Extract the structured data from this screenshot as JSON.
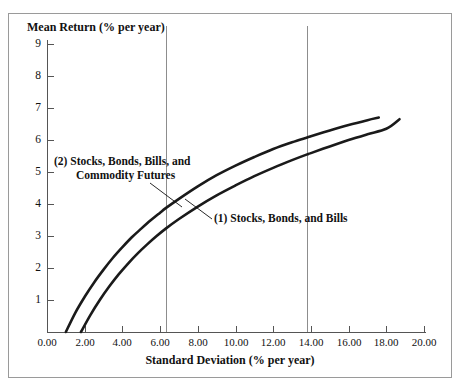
{
  "chart_data": {
    "type": "line",
    "title": "",
    "xlabel": "Standard Deviation (% per year)",
    "ylabel": "Mean Return (% per year)",
    "xlim": [
      0.0,
      20.0
    ],
    "ylim": [
      0.0,
      9.4
    ],
    "xticks": [
      "0.00",
      "2.00",
      "4.00",
      "6.00",
      "8.00",
      "10.00",
      "12.00",
      "14.00",
      "16.00",
      "18.00",
      "20.00"
    ],
    "xtick_values": [
      0,
      2,
      4,
      6,
      8,
      10,
      12,
      14,
      16,
      18,
      20
    ],
    "yticks": [
      "1",
      "2",
      "3",
      "4",
      "5",
      "6",
      "7",
      "8",
      "9"
    ],
    "ytick_values": [
      1,
      2,
      3,
      4,
      5,
      6,
      7,
      8,
      9
    ],
    "grid": false,
    "legend_position": "inline-annotations",
    "reference_lines": [
      {
        "name": "vline-left",
        "x": 6.3
      },
      {
        "name": "vline-right",
        "x": 13.8
      }
    ],
    "series": [
      {
        "name": "(2) Stocks, Bonds, Bills, and Commodity Futures",
        "label_number": "(2)",
        "label_text_line1": "Stocks, Bonds, Bills, and",
        "label_text_line2": "Commodity Futures",
        "points": [
          [
            1.0,
            0.0
          ],
          [
            1.5,
            0.6
          ],
          [
            2.0,
            1.1
          ],
          [
            2.5,
            1.55
          ],
          [
            3.0,
            1.95
          ],
          [
            3.5,
            2.32
          ],
          [
            4.0,
            2.65
          ],
          [
            4.5,
            2.96
          ],
          [
            5.0,
            3.23
          ],
          [
            5.5,
            3.49
          ],
          [
            6.0,
            3.73
          ],
          [
            6.3,
            3.87
          ],
          [
            7.0,
            4.16
          ],
          [
            8.0,
            4.55
          ],
          [
            9.0,
            4.9
          ],
          [
            10.0,
            5.2
          ],
          [
            11.0,
            5.47
          ],
          [
            12.0,
            5.72
          ],
          [
            13.0,
            5.93
          ],
          [
            13.8,
            6.08
          ],
          [
            14.0,
            6.12
          ],
          [
            15.0,
            6.3
          ],
          [
            16.0,
            6.47
          ],
          [
            17.0,
            6.62
          ],
          [
            17.6,
            6.7
          ]
        ]
      },
      {
        "name": "(1) Stocks, Bonds, and Bills",
        "label_number": "(1)",
        "label_text_line1": "Stocks, Bonds, and Bills",
        "label_text_line2": "",
        "points": [
          [
            1.8,
            0.0
          ],
          [
            2.3,
            0.53
          ],
          [
            2.8,
            1.0
          ],
          [
            3.3,
            1.42
          ],
          [
            3.8,
            1.8
          ],
          [
            4.3,
            2.14
          ],
          [
            4.8,
            2.45
          ],
          [
            5.3,
            2.73
          ],
          [
            5.8,
            2.99
          ],
          [
            6.3,
            3.23
          ],
          [
            7.0,
            3.53
          ],
          [
            8.0,
            3.92
          ],
          [
            9.0,
            4.27
          ],
          [
            10.0,
            4.58
          ],
          [
            11.0,
            4.87
          ],
          [
            12.0,
            5.13
          ],
          [
            13.0,
            5.37
          ],
          [
            13.8,
            5.55
          ],
          [
            14.0,
            5.59
          ],
          [
            15.0,
            5.8
          ],
          [
            16.0,
            6.0
          ],
          [
            17.0,
            6.18
          ],
          [
            18.0,
            6.35
          ],
          [
            18.7,
            6.65
          ]
        ]
      }
    ]
  },
  "annotations": {
    "series2": {
      "number": "(2)",
      "line1": "Stocks, Bonds, Bills, and",
      "line2": "Commodity Futures"
    },
    "series1": {
      "number": "(1)",
      "line1": "Stocks, Bonds, and Bills"
    }
  },
  "colors": {
    "curve": "#1a1a1a",
    "axis": "#555555",
    "reference_line": "#8d8d8d",
    "frame": "#9a9a9a",
    "text": "#111111",
    "background": "#ffffff"
  }
}
